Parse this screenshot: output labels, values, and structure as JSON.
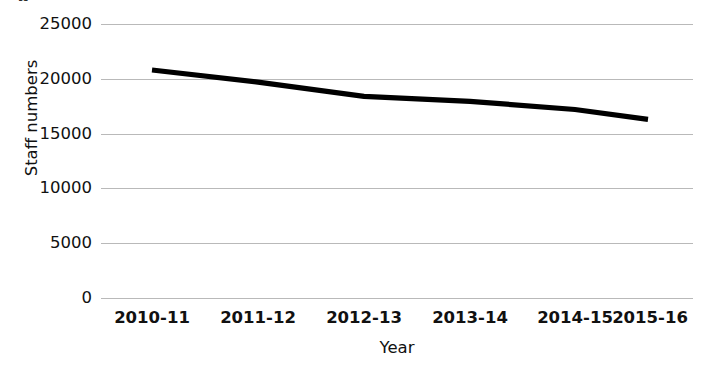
{
  "figure": {
    "clipped_caption": "g"
  },
  "chart_data": {
    "type": "line",
    "title": "",
    "subtitle": "",
    "xlabel": "Year",
    "ylabel": "Staff numbers",
    "categories": [
      "2010-11",
      "2011-12",
      "2012-13",
      "2013-14",
      "2014-15",
      "2015-16"
    ],
    "series": [
      {
        "name": "Staff numbers",
        "values": [
          20800,
          19700,
          18400,
          17950,
          17200,
          16300
        ],
        "color": "#000000",
        "line_width": 5
      }
    ],
    "ytick_labels": [
      "25000",
      "20000",
      "15000",
      "10000",
      "5000",
      "0"
    ],
    "ytick_values": [
      25000,
      20000,
      15000,
      10000,
      5000,
      0
    ],
    "ylim": [
      0,
      25000
    ],
    "grid": {
      "horizontal": true,
      "vertical": false,
      "color": "#b9b9b9"
    },
    "legend": {
      "visible": false,
      "position": "none"
    },
    "axis_lines": {
      "left": false,
      "bottom": false
    }
  }
}
